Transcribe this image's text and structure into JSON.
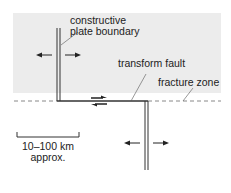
{
  "diagram": {
    "background_color": "#ececec",
    "line_color": "#333333",
    "dashed_color": "#888888",
    "labels": {
      "ridge_line1": "constructive",
      "ridge_line2": "plate boundary",
      "transform_fault": "transform fault",
      "fracture_zone": "fracture zone",
      "scale_line1": "10–100 km",
      "scale_line2": "approx."
    },
    "elements": [
      {
        "type": "ridge-segment",
        "position": "upper-left",
        "motion": "spreading left/right"
      },
      {
        "type": "transform-fault",
        "motion": "sinistral shear arrows (top right, bottom left)"
      },
      {
        "type": "ridge-segment",
        "position": "lower-right",
        "motion": "spreading left/right"
      },
      {
        "type": "fracture-zone",
        "style": "dashed",
        "extends": "both sides of transform"
      },
      {
        "type": "scale-bar",
        "label": "10–100 km approx."
      }
    ]
  }
}
